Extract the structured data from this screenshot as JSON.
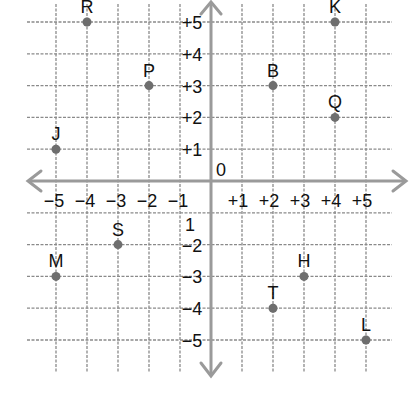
{
  "diagram": {
    "type": "coordinate-grid",
    "origin_label": "0",
    "x_axis": {
      "min": -5,
      "max": 5,
      "tick_labels": [
        "−5",
        "−4",
        "−3",
        "−2",
        "−1",
        "+1",
        "+2",
        "+3",
        "+4",
        "+5"
      ],
      "tick_values": [
        -5,
        -4,
        -3,
        -2,
        -1,
        1,
        2,
        3,
        4,
        5
      ]
    },
    "y_axis": {
      "min": -5,
      "max": 5,
      "tick_labels": [
        "+5",
        "+4",
        "+3",
        "+2",
        "+1",
        "1",
        "−2",
        "−3",
        "−4",
        "−5"
      ],
      "tick_values": [
        5,
        4,
        3,
        2,
        1,
        -1,
        -2,
        -3,
        -4,
        -5
      ]
    },
    "points": [
      {
        "label": "R",
        "x": -4,
        "y": 5
      },
      {
        "label": "K",
        "x": 4,
        "y": 5
      },
      {
        "label": "P",
        "x": -2,
        "y": 3
      },
      {
        "label": "B",
        "x": 2,
        "y": 3
      },
      {
        "label": "Q",
        "x": 4,
        "y": 2
      },
      {
        "label": "J",
        "x": -5,
        "y": 1
      },
      {
        "label": "S",
        "x": -3,
        "y": -2
      },
      {
        "label": "M",
        "x": -5,
        "y": -3
      },
      {
        "label": "H",
        "x": 3,
        "y": -3
      },
      {
        "label": "T",
        "x": 2,
        "y": -4
      },
      {
        "label": "L",
        "x": 5,
        "y": -5
      }
    ],
    "colors": {
      "grid": "#8a8a8a",
      "axis": "#9a9a9a",
      "point": "#6e6e6e",
      "text": "#111111"
    }
  }
}
